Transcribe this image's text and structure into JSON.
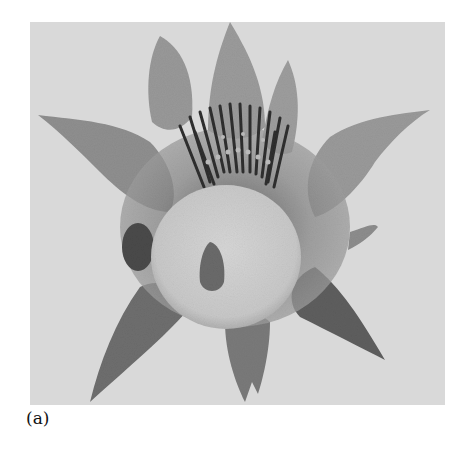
{
  "figure": {
    "caption": "(a)",
    "photo": {
      "subject": "flower-photograph",
      "style": "grayscale-halftone",
      "colors": {
        "background": "#d9d9d9",
        "petal": "#9a9a9a",
        "petal_dark": "#4a4a4a",
        "stamens": "#3a3a3a",
        "center_disc": "#cfcfcf",
        "seed": "#6a6a6a"
      }
    }
  }
}
